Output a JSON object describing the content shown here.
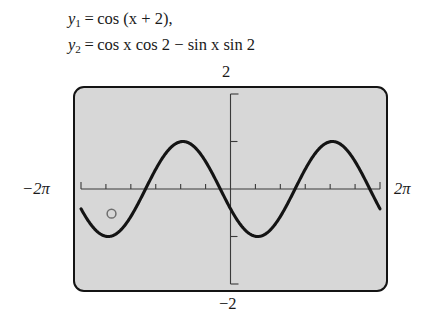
{
  "equations": {
    "line1": {
      "lhs_var": "y",
      "lhs_sub": "1",
      "equals": "=",
      "rhs": "cos (x + 2),"
    },
    "line2": {
      "lhs_var": "y",
      "lhs_sub": "2",
      "equals": "=",
      "rhs": "cos x cos 2 − sin x sin 2"
    },
    "plain_line1": "y₁ = cos (x + 2),",
    "plain_line2": "y₂ = cos x cos 2 − sin x sin 2"
  },
  "axis_labels": {
    "top": "2",
    "bottom": "−2",
    "left": "−2π",
    "right": "2π"
  },
  "colors": {
    "plot_background": "#d7d7d7",
    "page_background": "#ffffff",
    "curve": "#141414",
    "border": "#141414",
    "axis": "#3a3a3a",
    "marker": "#6e6e6e"
  },
  "chart_data": {
    "type": "line",
    "title": "",
    "xlabel": "",
    "ylabel": "",
    "xlim": [
      -6.2831853,
      6.2831853
    ],
    "ylim": [
      -2,
      2
    ],
    "xticks": [
      -6.2831853,
      -5.2359878,
      -4.1887902,
      -3.1415927,
      -2.0943951,
      -1.0471976,
      0,
      1.0471976,
      2.0943951,
      3.1415927,
      4.1887902,
      5.2359878,
      6.2831853
    ],
    "xtick_labels": [
      "−2π",
      "",
      "",
      "",
      "",
      "",
      "",
      "",
      "",
      "",
      "",
      "",
      "2π"
    ],
    "yticks": [
      -2,
      -1,
      0,
      1,
      2
    ],
    "ytick_labels": [
      "−2",
      "",
      "",
      "",
      "2"
    ],
    "grid": false,
    "legend": false,
    "series": [
      {
        "name": "y1 = cos(x + 2)  /  y2 = cos x cos 2 − sin x sin 2",
        "expression": "cos(x + 2)",
        "note": "y1 and y2 are identical curves (cosine sum identity); only one curve is visible",
        "color": "#141414",
        "x": [
          -6.2831853,
          -5.8905,
          -5.4978,
          -5.1051,
          -4.7124,
          -4.3197,
          -3.927,
          -3.5343,
          -3.1416,
          -2.7489,
          -2.3562,
          -1.9635,
          -1.5708,
          -1.1781,
          -0.7854,
          -0.3927,
          0,
          0.3927,
          0.7854,
          1.1781,
          1.5708,
          1.9635,
          2.3562,
          2.7489,
          3.1416,
          3.5343,
          3.927,
          4.3197,
          4.7124,
          5.1051,
          5.4978,
          5.8905,
          6.2831853
        ],
        "y": [
          -0.4161,
          -0.6895,
          -0.8855,
          -0.9898,
          -0.9093,
          -0.7568,
          -0.5403,
          -0.2675,
          0.0398,
          0.3466,
          0.6536,
          0.8855,
          0.9898,
          0.9093,
          0.7568,
          0.5403,
          -0.4161,
          -0.2675,
          0.0398,
          0.3466,
          0.6536,
          0.8855,
          0.9898,
          0.9093,
          0.7568,
          0.5403,
          0.2675,
          -0.0398,
          -0.3466,
          -0.6536,
          -0.8855,
          -0.9898,
          -0.4161
        ]
      }
    ],
    "markers": [
      {
        "name": "trace-point",
        "x": -5.0,
        "y": -0.52,
        "style": "open-circle",
        "color": "#6e6e6e"
      }
    ]
  }
}
